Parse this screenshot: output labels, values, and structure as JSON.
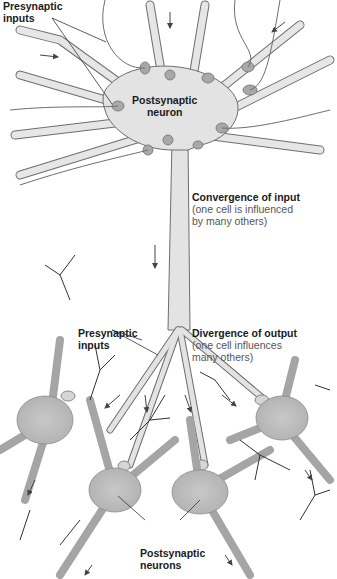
{
  "figure": {
    "colors": {
      "cell_fill": "#d6d6d6",
      "cell_fill_dark": "#bdbdbd",
      "cell_outline": "#6e6e6e",
      "terminal_fill": "#a8a8a8",
      "arrow": "#444444",
      "text": "#1a1a1a",
      "subtext": "#555555"
    },
    "labels": {
      "presynaptic_top": {
        "line1": "Presynaptic",
        "line2": "inputs"
      },
      "postsynaptic_top": {
        "line1": "Postsynaptic",
        "line2": "neuron"
      },
      "convergence": {
        "title": "Convergence of input",
        "desc_line1": "(one cell is influenced",
        "desc_line2": "by many others)"
      },
      "presynaptic_bottom": {
        "line1": "Presynaptic",
        "line2": "inputs"
      },
      "divergence": {
        "title": "Divergence of output",
        "desc_line1": "(one cell influences",
        "desc_line2": "many others)"
      },
      "postsynaptic_bottom": {
        "line1": "Postsynaptic",
        "line2": "neurons"
      }
    }
  }
}
